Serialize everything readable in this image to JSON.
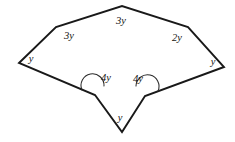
{
  "figure": {
    "kind": "polygon-angle-diagram",
    "shape_name": "concave-heptagon",
    "background_color": "#ffffff",
    "stroke_color": "#191919",
    "label_color": "#141414",
    "canvas": {
      "width": 235,
      "height": 142
    },
    "vertices": [
      {
        "id": "left",
        "name": "vertex-left",
        "x": 19,
        "y": 63,
        "angle_label": "y",
        "label_x": 31,
        "label_y": 59,
        "reflex": false
      },
      {
        "id": "upper-left",
        "name": "vertex-upper-left",
        "x": 56,
        "y": 27,
        "angle_label": "3y",
        "label_x": 69,
        "label_y": 36,
        "reflex": false
      },
      {
        "id": "apex",
        "name": "vertex-top-apex",
        "x": 122,
        "y": 6,
        "angle_label": "3y",
        "label_x": 121,
        "label_y": 21,
        "reflex": false
      },
      {
        "id": "upper-right",
        "name": "vertex-upper-right",
        "x": 188,
        "y": 27,
        "angle_label": "2y",
        "label_x": 177,
        "label_y": 38,
        "reflex": false
      },
      {
        "id": "right",
        "name": "vertex-right",
        "x": 224,
        "y": 67,
        "angle_label": "y",
        "label_x": 213,
        "label_y": 62,
        "reflex": false
      },
      {
        "id": "notch-right",
        "name": "vertex-notch-right",
        "x": 145,
        "y": 96,
        "angle_label": "4y",
        "label_x": 138,
        "label_y": 79,
        "reflex": true
      },
      {
        "id": "bottom",
        "name": "vertex-bottom",
        "x": 122,
        "y": 132,
        "angle_label": "y",
        "label_x": 120,
        "label_y": 118,
        "reflex": false
      },
      {
        "id": "notch-left",
        "name": "vertex-notch-left",
        "x": 95,
        "y": 95,
        "angle_label": "4y",
        "label_x": 106,
        "label_y": 78,
        "reflex": true
      }
    ],
    "outline_path": "M 19,63 L 56,27 L 122,6 L 188,27 L 224,67 L 145,96 L 122,132 L 95,95 Z",
    "reflex_arcs": [
      {
        "name": "reflex-angle-arc-left",
        "path": "M 82,90 A 11.5,11.5 0 1 1 104,86"
      },
      {
        "name": "reflex-angle-arc-right",
        "path": "M 136,86 A 11.5,11.5 0 1 1 158,91"
      }
    ],
    "angle_expressions": [
      "y",
      "3y",
      "3y",
      "2y",
      "y",
      "4y",
      "y",
      "4y"
    ]
  }
}
